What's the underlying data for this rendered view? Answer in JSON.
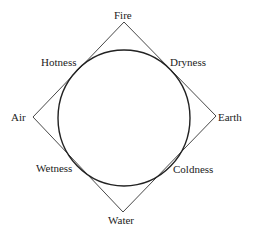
{
  "diagram": {
    "title": "",
    "elements": {
      "top": "Fire",
      "left": "Air",
      "right": "Earth",
      "bottom": "Water"
    },
    "qualities": {
      "upper_left": "Hotness",
      "upper_right": "Dryness",
      "lower_left": "Wetness",
      "lower_right": "Coldness"
    },
    "colors": {
      "line": "#333333",
      "background": "#ffffff"
    }
  }
}
